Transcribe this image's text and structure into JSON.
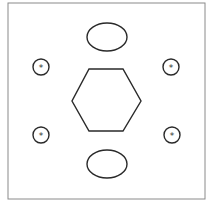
{
  "diagram": {
    "frame": {
      "x": 8,
      "y": 3,
      "width": 197,
      "height": 196,
      "color": "#8a8a8a"
    },
    "stroke_color": "#2a2a2a",
    "hexagon": {
      "points": "89,69 123,69 141,101 123,131 89,131 72,101"
    },
    "ellipses": [
      {
        "name": "top-ellipse",
        "cx": 107,
        "cy": 37,
        "rx": 20,
        "ry": 14
      },
      {
        "name": "bottom-ellipse",
        "cx": 107,
        "cy": 164,
        "rx": 20,
        "ry": 14
      }
    ],
    "marked_circles": [
      {
        "name": "top-left",
        "cx": 41,
        "cy": 67,
        "r": 8,
        "mark": "*"
      },
      {
        "name": "top-right",
        "cx": 171,
        "cy": 67,
        "r": 8,
        "mark": "*"
      },
      {
        "name": "bottom-left",
        "cx": 41,
        "cy": 135,
        "r": 8,
        "mark": "*"
      },
      {
        "name": "bottom-right",
        "cx": 172,
        "cy": 135,
        "r": 8,
        "mark": "*"
      }
    ]
  }
}
